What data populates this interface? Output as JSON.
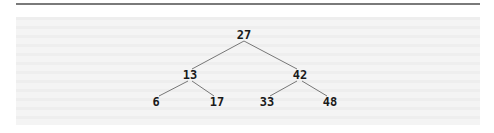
{
  "diagram": {
    "type": "binary-search-tree",
    "colors": {
      "rule": "#7a7a7a",
      "panel_background": "#f1f1f1",
      "edge": "#777777",
      "label": "#1a1a1a"
    },
    "nodes": [
      {
        "id": "n27",
        "label": "27",
        "x": 244,
        "y": 35
      },
      {
        "id": "n13",
        "label": "13",
        "x": 190,
        "y": 75
      },
      {
        "id": "n42",
        "label": "42",
        "x": 300,
        "y": 75
      },
      {
        "id": "n6",
        "label": "6",
        "x": 156,
        "y": 102
      },
      {
        "id": "n17",
        "label": "17",
        "x": 217,
        "y": 102
      },
      {
        "id": "n33",
        "label": "33",
        "x": 267,
        "y": 102
      },
      {
        "id": "n48",
        "label": "48",
        "x": 330,
        "y": 102
      }
    ],
    "edges": [
      {
        "from": "n27",
        "to": "n13",
        "x1": 244,
        "y1": 41,
        "x2": 192,
        "y2": 69
      },
      {
        "from": "n27",
        "to": "n42",
        "x1": 244,
        "y1": 41,
        "x2": 297,
        "y2": 69
      },
      {
        "from": "n13",
        "to": "n6",
        "x1": 188,
        "y1": 81,
        "x2": 159,
        "y2": 96
      },
      {
        "from": "n13",
        "to": "n17",
        "x1": 192,
        "y1": 81,
        "x2": 214,
        "y2": 96
      },
      {
        "from": "n42",
        "to": "n33",
        "x1": 297,
        "y1": 81,
        "x2": 270,
        "y2": 96
      },
      {
        "from": "n42",
        "to": "n48",
        "x1": 302,
        "y1": 81,
        "x2": 327,
        "y2": 96
      }
    ]
  }
}
